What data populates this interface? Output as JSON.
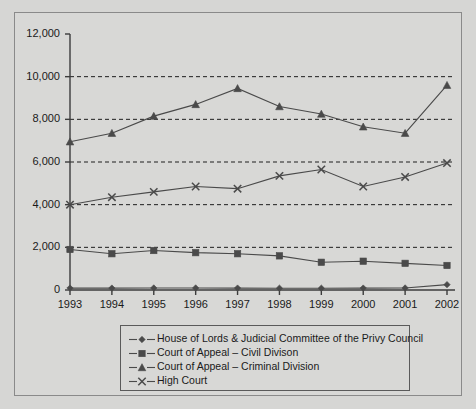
{
  "chart_data": {
    "type": "line",
    "title": "",
    "xlabel": "",
    "ylabel": "",
    "categories": [
      "1993",
      "1994",
      "1995",
      "1996",
      "1997",
      "1998",
      "1999",
      "2000",
      "2001",
      "2002"
    ],
    "x": [
      1993,
      1994,
      1995,
      1996,
      1997,
      1998,
      1999,
      2000,
      2001,
      2002
    ],
    "ylim": [
      0,
      12000
    ],
    "yticks": [
      0,
      2000,
      4000,
      6000,
      8000,
      10000,
      12000
    ],
    "ytick_labels": [
      "0",
      "2,000",
      "4,000",
      "6,000",
      "8,000",
      "10,000",
      "12,000"
    ],
    "grid": "horizontal-dashed",
    "legend_position": "below-axes",
    "series": [
      {
        "name": "House of Lords & Judicial Committee of the Privy Council",
        "marker": "diamond",
        "values": [
          90,
          90,
          95,
          95,
          90,
          85,
          85,
          90,
          95,
          250
        ]
      },
      {
        "name": "Court of Appeal – Civil Divison",
        "marker": "square",
        "values": [
          1900,
          1700,
          1850,
          1750,
          1700,
          1600,
          1300,
          1350,
          1250,
          1150
        ]
      },
      {
        "name": "Court of Appeal – Criminal Division",
        "marker": "triangle",
        "values": [
          6950,
          7350,
          8150,
          8700,
          9450,
          8600,
          8250,
          7650,
          7350,
          9600
        ]
      },
      {
        "name": "High Court",
        "marker": "cross",
        "values": [
          4000,
          4350,
          4600,
          4850,
          4750,
          5350,
          5650,
          4850,
          5300,
          5950
        ]
      }
    ]
  },
  "legend": {
    "items": [
      {
        "label": "House of Lords & Judicial Committee of the Privy Council",
        "marker": "diamond"
      },
      {
        "label": "Court of Appeal – Civil Divison",
        "marker": "square"
      },
      {
        "label": "Court of Appeal – Criminal Division",
        "marker": "triangle"
      },
      {
        "label": "High Court",
        "marker": "cross"
      }
    ]
  },
  "colors": {
    "background": "#d6d6d4",
    "frame_border": "#8a8a8a",
    "axis": "#3c3c3c",
    "series": "#4a4a4a",
    "grid": "#1e1e1e",
    "text": "#1a1a1a"
  }
}
